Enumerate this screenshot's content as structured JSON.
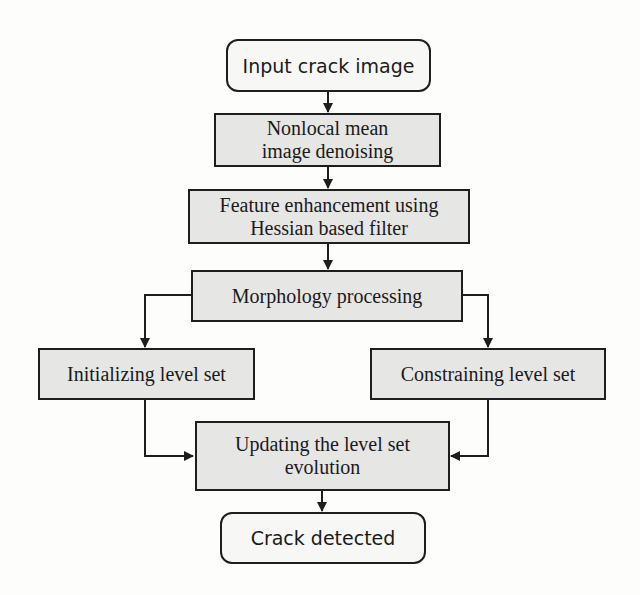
{
  "diagram": {
    "type": "flowchart",
    "nodes": {
      "input": {
        "label": "Input crack image",
        "shape": "rounded"
      },
      "denoise": {
        "label": "Nonlocal mean\nimage denoising",
        "shape": "rect"
      },
      "enhance": {
        "label": "Feature enhancement using\nHessian based filter",
        "shape": "rect"
      },
      "morph": {
        "label": "Morphology processing",
        "shape": "rect"
      },
      "init": {
        "label": "Initializing level set",
        "shape": "rect"
      },
      "constrain": {
        "label": "Constraining level set",
        "shape": "rect"
      },
      "update": {
        "label": "Updating the level set\nevolution",
        "shape": "rect"
      },
      "output": {
        "label": "Crack detected",
        "shape": "rounded"
      }
    },
    "edges": [
      {
        "from": "input",
        "to": "denoise"
      },
      {
        "from": "denoise",
        "to": "enhance"
      },
      {
        "from": "enhance",
        "to": "morph"
      },
      {
        "from": "morph",
        "to": "init"
      },
      {
        "from": "morph",
        "to": "constrain"
      },
      {
        "from": "init",
        "to": "update"
      },
      {
        "from": "constrain",
        "to": "update"
      },
      {
        "from": "update",
        "to": "output"
      }
    ],
    "colors": {
      "box_fill": "#e6e6e4",
      "terminal_fill": "#f7f7f6",
      "stroke": "#1e1e1e",
      "background": "#fdfdfc"
    }
  }
}
